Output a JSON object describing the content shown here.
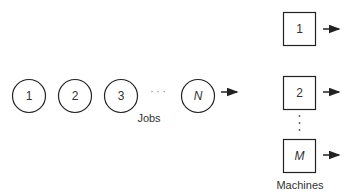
{
  "diagram": {
    "stroke_color": "#222222",
    "jobs": {
      "label": "Jobs",
      "items": [
        {
          "text": "1",
          "cx": 29,
          "cy": 96,
          "italic": false
        },
        {
          "text": "2",
          "cx": 75,
          "cy": 96,
          "italic": false
        },
        {
          "text": "3",
          "cx": 121,
          "cy": 96,
          "italic": false
        },
        {
          "text": "N",
          "cx": 198,
          "cy": 96,
          "italic": true
        }
      ],
      "ellipsis": "· · ·",
      "arrow": {
        "x1": 221,
        "x2": 238,
        "y": 92
      }
    },
    "machines": {
      "label": "Machines",
      "items": [
        {
          "text": "1",
          "x": 283,
          "y": 12,
          "italic": false,
          "arrow_y": 29
        },
        {
          "text": "2",
          "x": 283,
          "y": 76,
          "italic": false,
          "arrow_y": 92
        },
        {
          "text": "M",
          "x": 283,
          "y": 139,
          "italic": true,
          "arrow_y": 155
        }
      ],
      "vertical_ellipsis": "⋮"
    }
  }
}
